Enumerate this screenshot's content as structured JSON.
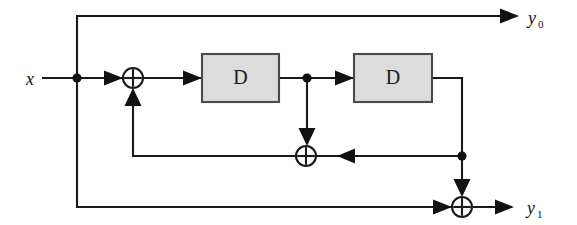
{
  "figure": {
    "type": "block-diagram",
    "background_color": "#ffffff",
    "line_color": "#1a1a1a",
    "block_fill_color": "#dcdcdc",
    "block_border_color": "#4a4a4a"
  },
  "labels": {
    "input": {
      "text": "x",
      "subscript": ""
    },
    "output_top": {
      "text": "y",
      "subscript": "0"
    },
    "output_bottom": {
      "text": "y",
      "subscript": "1"
    }
  },
  "blocks": [
    {
      "id": "delay-1",
      "label": "D",
      "name": "delay-block-1",
      "x": 202,
      "y": 54,
      "width": 77,
      "height": 48
    },
    {
      "id": "delay-2",
      "label": "D",
      "name": "delay-block-2",
      "x": 354,
      "y": 54,
      "width": 78,
      "height": 48
    }
  ],
  "adders": [
    {
      "id": "adder-1",
      "name": "xor-adder-input",
      "symbol": "plus-in-circle",
      "cx": 133,
      "cy": 78,
      "r": 10
    },
    {
      "id": "adder-2",
      "name": "xor-adder-middle",
      "symbol": "plus-in-circle",
      "cx": 306,
      "cy": 156,
      "r": 10
    },
    {
      "id": "adder-3",
      "name": "xor-adder-output",
      "symbol": "plus-in-circle",
      "cx": 462,
      "cy": 207,
      "r": 10
    }
  ],
  "junctions": [
    {
      "id": "node-input-tap",
      "name": "input-tap-node",
      "cx": 77,
      "cy": 78
    },
    {
      "id": "node-delay1-tap",
      "name": "delay1-output-tap-node",
      "cx": 307,
      "cy": 78
    },
    {
      "id": "node-delay2-tap",
      "name": "delay2-output-tap-node",
      "cx": 462,
      "cy": 156
    }
  ],
  "connections": [
    {
      "from": "x-input",
      "to": "input-tap-node"
    },
    {
      "from": "input-tap-node",
      "to": "adder-1"
    },
    {
      "from": "input-tap-node",
      "to": "y0-output-line"
    },
    {
      "from": "input-tap-node",
      "to": "adder-3"
    },
    {
      "from": "adder-1",
      "to": "delay-1"
    },
    {
      "from": "delay-1",
      "to": "delay1-output-tap-node"
    },
    {
      "from": "delay1-output-tap-node",
      "to": "delay-2"
    },
    {
      "from": "delay1-output-tap-node",
      "to": "adder-2"
    },
    {
      "from": "delay-2",
      "to": "delay2-output-tap-node"
    },
    {
      "from": "delay2-output-tap-node",
      "to": "adder-2"
    },
    {
      "from": "delay2-output-tap-node",
      "to": "adder-3"
    },
    {
      "from": "adder-2",
      "to": "adder-1"
    },
    {
      "from": "adder-3",
      "to": "y1-output"
    }
  ]
}
